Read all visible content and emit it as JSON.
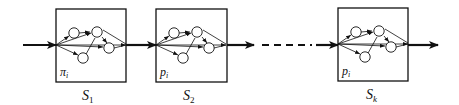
{
  "diagram": {
    "type": "serial chain of stages, each containing a small network",
    "colors": {
      "stroke": "#111111",
      "background": "#ffffff"
    },
    "stages": [
      {
        "id": "S1",
        "name": "S",
        "subscript": "1",
        "inner_label": "π",
        "inner_subscript": "i",
        "x": 56,
        "y": 9,
        "w": 70,
        "h": 73
      },
      {
        "id": "S2",
        "name": "S",
        "subscript": "2",
        "inner_label": "p",
        "inner_subscript": "i",
        "x": 156,
        "y": 9,
        "w": 71,
        "h": 73
      },
      {
        "id": "Sk",
        "name": "S",
        "subscript": "k",
        "inner_label": "p",
        "inner_subscript": "i",
        "x": 338,
        "y": 8,
        "w": 70,
        "h": 73
      }
    ],
    "connectors": [
      {
        "from": "input",
        "to": "S1",
        "style": "solid-arrow"
      },
      {
        "from": "S1",
        "to": "S2",
        "style": "solid-arrow"
      },
      {
        "from": "S2",
        "to": "Sk",
        "style": "dashed-arrow"
      },
      {
        "from": "Sk",
        "to": "output",
        "style": "solid-arrow"
      }
    ],
    "inner_network": {
      "nodes": 4,
      "edges": "source fans out to nodes and directly to sink; nodes interconnect and converge on sink"
    }
  }
}
